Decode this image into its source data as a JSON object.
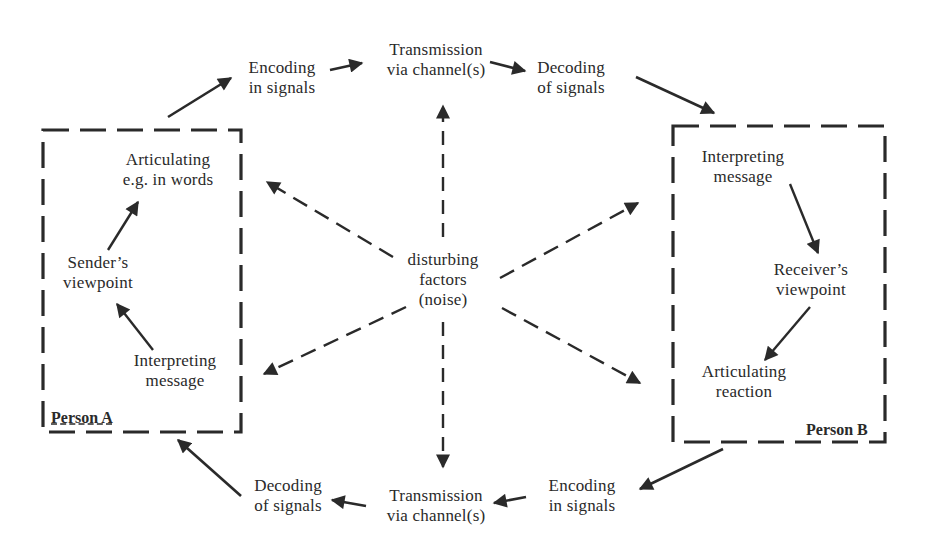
{
  "diagram": {
    "type": "communication-model",
    "colors": {
      "ink": "#2a2a2a",
      "background": "#ffffff"
    },
    "top_flow": {
      "encoding": {
        "line1": "Encoding",
        "line2": "in signals"
      },
      "transmission": {
        "line1": "Transmission",
        "line2": "via channel(s)"
      },
      "decoding": {
        "line1": "Decoding",
        "line2": "of signals"
      }
    },
    "bottom_flow": {
      "decoding": {
        "line1": "Decoding",
        "line2": "of signals"
      },
      "transmission": {
        "line1": "Transmission",
        "line2": "via channel(s)"
      },
      "encoding": {
        "line1": "Encoding",
        "line2": "in signals"
      }
    },
    "noise": {
      "line1": "disturbing",
      "line2": "factors",
      "line3": "(noise)"
    },
    "person_a": {
      "label": "Person A",
      "articulating": {
        "line1": "Articulating",
        "line2": "e.g. in words"
      },
      "viewpoint": {
        "line1": "Sender’s",
        "line2": "viewpoint"
      },
      "interpreting": {
        "line1": "Interpreting",
        "line2": "message"
      }
    },
    "person_b": {
      "label": "Person B",
      "interpreting": {
        "line1": "Interpreting",
        "line2": "message"
      },
      "viewpoint": {
        "line1": "Receiver’s",
        "line2": "viewpoint"
      },
      "articulating": {
        "line1": "Articulating",
        "line2": "reaction"
      }
    }
  }
}
